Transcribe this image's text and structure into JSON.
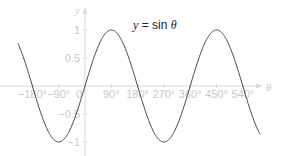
{
  "chart_data": {
    "type": "line",
    "title": "y = sin θ",
    "title_parts": {
      "lhs": "y",
      "eq": " = sin ",
      "var": "θ"
    },
    "xlabel": "θ",
    "ylabel": "y",
    "x_unit": "degrees",
    "xlim": [
      -230,
      600
    ],
    "ylim": [
      -1,
      1
    ],
    "x_ticks": [
      -180,
      -90,
      0,
      90,
      180,
      270,
      360,
      450,
      540
    ],
    "x_tick_labels": [
      "−180°",
      "−90°",
      "0",
      "90°",
      "180°",
      "270°",
      "360°",
      "450°",
      "540°"
    ],
    "y_ticks": [
      1,
      0.5,
      -0.5,
      -1
    ],
    "y_tick_labels": [
      "1",
      "0.5",
      "−0.5",
      "−1"
    ],
    "grid": false,
    "legend": null,
    "series": [
      {
        "name": "sin θ",
        "function": "sin",
        "color": "#444444",
        "x": [
          -230,
          -180,
          -90,
          0,
          90,
          180,
          270,
          360,
          450,
          540,
          600
        ],
        "values": [
          0.766,
          0,
          -1,
          0,
          1,
          0,
          -1,
          0,
          1,
          0,
          -0.866
        ]
      }
    ]
  },
  "colors": {
    "axis": "#d9d9d9",
    "tick_label": "#c8c8c8",
    "curve": "#444444",
    "title": "#222222"
  },
  "layout": {
    "origin_x": 85,
    "origin_y": 86,
    "px_per_90deg": 26.3,
    "px_per_unit": 56,
    "x_axis_end": 262,
    "y_axis_top": 8
  }
}
